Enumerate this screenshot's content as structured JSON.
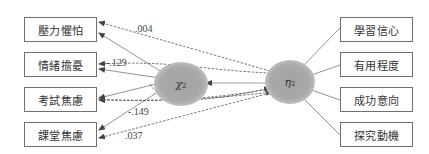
{
  "diagram": {
    "left_indicators": [
      {
        "label": "壓力懼怕"
      },
      {
        "label": "情緒擔憂"
      },
      {
        "label": "考試焦慮"
      },
      {
        "label": "課堂焦慮"
      }
    ],
    "right_indicators": [
      {
        "label": "學習信心"
      },
      {
        "label": "有用程度"
      },
      {
        "label": "成功意向"
      },
      {
        "label": "探究動機"
      }
    ],
    "latent_variables": [
      {
        "symbol": "χ",
        "subscript": "2"
      },
      {
        "symbol": "η",
        "subscript": "2"
      }
    ],
    "coefficients": [
      {
        "value": ".004"
      },
      {
        "value": "-.129"
      },
      {
        "value": "-.149"
      },
      {
        "value": ".037"
      }
    ],
    "colors": {
      "line": "#555555",
      "latent_fill": "#a9a9a9",
      "box_border": "#6f6f6f"
    }
  }
}
